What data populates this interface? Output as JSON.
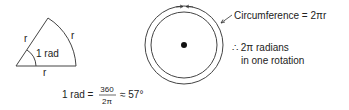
{
  "sector": {
    "radius_label_left": "r",
    "radius_label_arc": "r",
    "radius_label_bottom": "r",
    "angle_label": "1 rad"
  },
  "formula": {
    "lhs": "1 rad =",
    "numerator": "360",
    "denominator": "2π",
    "approx": "≈ 57°"
  },
  "circle": {
    "circumference_label": "Circumference = 2πr",
    "therefore_line1": "∴ 2π radians",
    "therefore_line2": "in one rotation"
  }
}
